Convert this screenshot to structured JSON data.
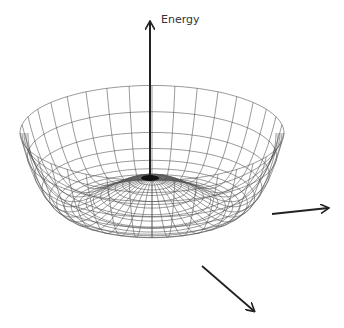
{
  "diagram": {
    "axis_label": "Energy",
    "line_color": "#222222",
    "mesh_color": "#555555",
    "center": [
      152,
      178
    ],
    "rim_radius": 132,
    "aspect": 0.36,
    "depth": 92,
    "peak_height": 0,
    "radial_lines": 36,
    "rings": 18
  }
}
